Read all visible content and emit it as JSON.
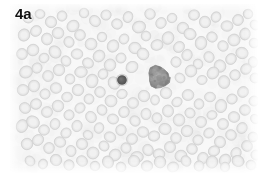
{
  "figure": {
    "panel_label": "4a",
    "label_color": "#111111",
    "kind": "light-microscopy-blood-smear",
    "frame": {
      "x": 10,
      "y": 4,
      "width": 248,
      "height": 169
    },
    "page_background": "#ffffff",
    "field_background": "#f7f7f7"
  },
  "palette": {
    "background": "#f7f7f7",
    "erythrocyte_fill": "#e2e2e2",
    "erythrocyte_rim": "#d5d5d5",
    "erythrocyte_center": "#eeeeee",
    "dark_small_cell": "#3f3f3f",
    "dark_large_cell": "#7d7d7d",
    "dark_large_cell_rim": "#6a6a6a"
  },
  "chart_data": {
    "type": "scatter",
    "title": "4a",
    "xlabel": "",
    "ylabel": "",
    "xlim": [
      0,
      248
    ],
    "ylim": [
      0,
      169
    ],
    "grid": false,
    "legend": null,
    "series": [
      {
        "name": "erythrocytes",
        "marker": "disc",
        "color": "#e2e2e2",
        "radius_range": [
          4.5,
          6.8
        ],
        "points": [
          [
            18,
            14,
            5.6
          ],
          [
            30,
            10,
            5.2
          ],
          [
            41,
            18,
            6.0
          ],
          [
            52,
            12,
            5.4
          ],
          [
            63,
            22,
            5.8
          ],
          [
            74,
            9,
            5.0
          ],
          [
            85,
            17,
            6.2
          ],
          [
            96,
            11,
            5.3
          ],
          [
            107,
            20,
            5.7
          ],
          [
            118,
            13,
            5.1
          ],
          [
            129,
            23,
            6.1
          ],
          [
            140,
            10,
            5.5
          ],
          [
            151,
            19,
            5.9
          ],
          [
            162,
            14,
            5.2
          ],
          [
            173,
            24,
            6.0
          ],
          [
            184,
            11,
            5.4
          ],
          [
            195,
            18,
            5.8
          ],
          [
            206,
            13,
            5.0
          ],
          [
            217,
            22,
            6.3
          ],
          [
            228,
            16,
            5.6
          ],
          [
            238,
            10,
            5.1
          ],
          [
            245,
            21,
            5.5
          ],
          [
            14,
            31,
            6.0
          ],
          [
            26,
            27,
            5.4
          ],
          [
            37,
            35,
            5.8
          ],
          [
            48,
            29,
            6.1
          ],
          [
            59,
            38,
            5.3
          ],
          [
            70,
            31,
            5.7
          ],
          [
            81,
            40,
            6.2
          ],
          [
            92,
            33,
            5.0
          ],
          [
            103,
            42,
            5.9
          ],
          [
            114,
            35,
            5.5
          ],
          [
            125,
            44,
            6.0
          ],
          [
            136,
            32,
            5.2
          ],
          [
            147,
            41,
            5.6
          ],
          [
            158,
            34,
            6.1
          ],
          [
            169,
            43,
            5.4
          ],
          [
            180,
            30,
            5.8
          ],
          [
            191,
            39,
            6.0
          ],
          [
            202,
            33,
            5.3
          ],
          [
            213,
            42,
            5.7
          ],
          [
            224,
            36,
            6.2
          ],
          [
            235,
            30,
            5.5
          ],
          [
            244,
            39,
            5.1
          ],
          [
            12,
            50,
            5.7
          ],
          [
            23,
            46,
            6.0
          ],
          [
            34,
            54,
            5.3
          ],
          [
            45,
            48,
            5.9
          ],
          [
            56,
            57,
            5.6
          ],
          [
            67,
            50,
            6.1
          ],
          [
            78,
            59,
            5.2
          ],
          [
            89,
            52,
            5.8
          ],
          [
            100,
            61,
            6.0
          ],
          [
            111,
            54,
            5.4
          ],
          [
            122,
            63,
            5.7
          ],
          [
            133,
            50,
            5.9
          ],
          [
            166,
            58,
            5.5
          ],
          [
            177,
            51,
            6.0
          ],
          [
            188,
            60,
            5.3
          ],
          [
            199,
            53,
            5.8
          ],
          [
            210,
            62,
            6.1
          ],
          [
            221,
            55,
            5.4
          ],
          [
            232,
            49,
            5.9
          ],
          [
            243,
            58,
            5.6
          ],
          [
            16,
            68,
            6.1
          ],
          [
            27,
            64,
            5.5
          ],
          [
            38,
            72,
            5.8
          ],
          [
            49,
            66,
            6.0
          ],
          [
            60,
            75,
            5.3
          ],
          [
            71,
            68,
            5.7
          ],
          [
            82,
            77,
            6.2
          ],
          [
            93,
            70,
            5.1
          ],
          [
            104,
            79,
            5.9
          ],
          [
            170,
            74,
            5.6
          ],
          [
            181,
            67,
            6.0
          ],
          [
            192,
            76,
            5.4
          ],
          [
            203,
            69,
            5.8
          ],
          [
            214,
            78,
            6.1
          ],
          [
            225,
            71,
            5.5
          ],
          [
            236,
            65,
            5.9
          ],
          [
            245,
            74,
            5.2
          ],
          [
            13,
            86,
            5.8
          ],
          [
            24,
            82,
            6.1
          ],
          [
            35,
            90,
            5.4
          ],
          [
            46,
            84,
            5.9
          ],
          [
            57,
            93,
            5.6
          ],
          [
            68,
            86,
            6.0
          ],
          [
            79,
            95,
            5.2
          ],
          [
            90,
            88,
            5.7
          ],
          [
            101,
            97,
            6.1
          ],
          [
            112,
            90,
            5.5
          ],
          [
            123,
            99,
            5.8
          ],
          [
            134,
            92,
            6.0
          ],
          [
            145,
            96,
            5.3
          ],
          [
            156,
            89,
            5.9
          ],
          [
            167,
            98,
            5.6
          ],
          [
            178,
            91,
            6.1
          ],
          [
            189,
            100,
            5.4
          ],
          [
            200,
            93,
            5.8
          ],
          [
            211,
            102,
            6.0
          ],
          [
            222,
            95,
            5.5
          ],
          [
            233,
            88,
            5.9
          ],
          [
            244,
            97,
            5.2
          ],
          [
            15,
            104,
            6.0
          ],
          [
            26,
            100,
            5.5
          ],
          [
            37,
            108,
            5.8
          ],
          [
            48,
            102,
            6.1
          ],
          [
            59,
            111,
            5.3
          ],
          [
            70,
            104,
            5.7
          ],
          [
            81,
            113,
            6.2
          ],
          [
            92,
            106,
            5.1
          ],
          [
            103,
            115,
            5.9
          ],
          [
            114,
            108,
            5.5
          ],
          [
            125,
            117,
            5.7
          ],
          [
            136,
            110,
            6.0
          ],
          [
            147,
            114,
            5.4
          ],
          [
            158,
            107,
            5.8
          ],
          [
            169,
            116,
            6.1
          ],
          [
            180,
            109,
            5.5
          ],
          [
            191,
            118,
            5.9
          ],
          [
            202,
            111,
            5.3
          ],
          [
            213,
            120,
            5.7
          ],
          [
            224,
            113,
            6.0
          ],
          [
            235,
            106,
            5.6
          ],
          [
            245,
            115,
            5.2
          ],
          [
            12,
            122,
            5.9
          ],
          [
            23,
            118,
            6.1
          ],
          [
            34,
            126,
            5.4
          ],
          [
            45,
            120,
            5.8
          ],
          [
            56,
            129,
            5.6
          ],
          [
            67,
            122,
            6.0
          ],
          [
            78,
            131,
            5.2
          ],
          [
            89,
            124,
            5.7
          ],
          [
            100,
            133,
            6.1
          ],
          [
            111,
            126,
            5.5
          ],
          [
            122,
            135,
            5.8
          ],
          [
            133,
            128,
            6.0
          ],
          [
            144,
            132,
            5.3
          ],
          [
            155,
            125,
            5.9
          ],
          [
            166,
            134,
            5.6
          ],
          [
            177,
            127,
            6.1
          ],
          [
            188,
            136,
            5.4
          ],
          [
            199,
            129,
            5.8
          ],
          [
            210,
            138,
            6.0
          ],
          [
            221,
            131,
            5.5
          ],
          [
            232,
            124,
            5.9
          ],
          [
            243,
            133,
            5.2
          ],
          [
            17,
            140,
            6.0
          ],
          [
            28,
            136,
            5.5
          ],
          [
            39,
            144,
            5.8
          ],
          [
            50,
            138,
            6.1
          ],
          [
            61,
            147,
            5.3
          ],
          [
            72,
            140,
            5.7
          ],
          [
            83,
            149,
            6.2
          ],
          [
            94,
            142,
            5.1
          ],
          [
            105,
            151,
            5.9
          ],
          [
            116,
            144,
            5.5
          ],
          [
            127,
            153,
            5.7
          ],
          [
            138,
            146,
            6.0
          ],
          [
            149,
            150,
            5.4
          ],
          [
            160,
            143,
            5.8
          ],
          [
            171,
            152,
            6.1
          ],
          [
            182,
            145,
            5.5
          ],
          [
            193,
            154,
            5.9
          ],
          [
            204,
            147,
            5.3
          ],
          [
            215,
            156,
            5.7
          ],
          [
            226,
            149,
            6.0
          ],
          [
            237,
            142,
            5.6
          ],
          [
            246,
            151,
            5.2
          ],
          [
            20,
            157,
            5.6
          ],
          [
            33,
            160,
            5.2
          ],
          [
            46,
            156,
            5.8
          ],
          [
            59,
            161,
            5.4
          ],
          [
            72,
            157,
            6.0
          ],
          [
            85,
            162,
            5.1
          ],
          [
            98,
            158,
            5.7
          ],
          [
            111,
            163,
            5.3
          ],
          [
            124,
            157,
            5.9
          ],
          [
            137,
            162,
            5.5
          ],
          [
            150,
            158,
            6.0
          ],
          [
            163,
            163,
            5.2
          ],
          [
            176,
            157,
            5.8
          ],
          [
            189,
            162,
            5.4
          ],
          [
            202,
            158,
            6.0
          ],
          [
            215,
            163,
            5.1
          ],
          [
            228,
            157,
            5.7
          ],
          [
            241,
            161,
            5.3
          ]
        ]
      },
      {
        "name": "dark-small-cell",
        "marker": "disc",
        "color": "#3f3f3f",
        "points": [
          [
            112,
            76,
            4.6
          ]
        ]
      },
      {
        "name": "dark-large-cell",
        "marker": "irregular-blob",
        "color": "#7d7d7d",
        "points": [
          [
            141,
            68,
            12.0
          ]
        ]
      }
    ],
    "annotations": [
      {
        "text": "4a",
        "x": 5,
        "y": 6,
        "bold": true,
        "color": "#111111"
      }
    ]
  }
}
